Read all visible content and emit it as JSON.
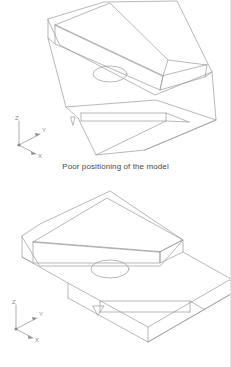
{
  "document": {
    "title": "Model positioning illustration",
    "background_color": "#ffffff",
    "line_color": "#9a9a9a",
    "text_color": "#4a4a4a",
    "axis_color": "#8d8d8d"
  },
  "figures": [
    {
      "id": "poor-positioning",
      "caption": "Poor positioning of the model",
      "orientation": "poor",
      "axis_triad": {
        "z_label": "Z",
        "y_label": "Y",
        "x_label": "X"
      },
      "features": [
        "wedge block",
        "angled raised rib",
        "circular through hole",
        "stepped base plate",
        "corner notch"
      ]
    },
    {
      "id": "preferred-positioning",
      "caption": "Preferred positioning of the model",
      "orientation": "preferred",
      "axis_triad": {
        "z_label": "Z",
        "y_label": "Y",
        "x_label": "X"
      },
      "features": [
        "wedge block",
        "angled raised rib",
        "circular through hole",
        "stepped base plate",
        "corner notch"
      ]
    }
  ]
}
